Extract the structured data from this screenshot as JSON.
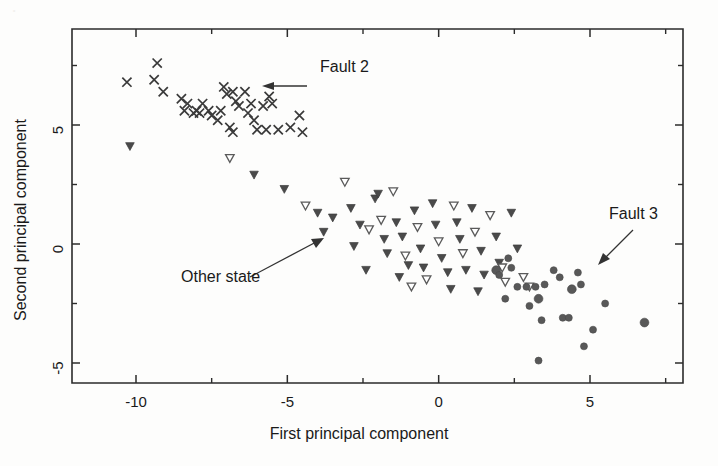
{
  "figure": {
    "title": "",
    "background_color": "#fdfdfc",
    "foreground_color": "#1a1a1a"
  },
  "axes": {
    "x_title": "First principal component",
    "y_title": "Second principal component",
    "x_tick_labels": [
      "-10",
      "-5",
      "0",
      "5"
    ],
    "y_tick_labels": [
      "5",
      "0",
      "-5"
    ]
  },
  "annotations": [
    {
      "id": "fault2",
      "label": "Fault 2",
      "x": 320,
      "y": 68
    },
    {
      "id": "other-state",
      "label": "Other state",
      "x": 181,
      "y": 276
    },
    {
      "id": "fault3",
      "label": "Fault 3",
      "x": 609,
      "y": 215
    }
  ],
  "chart_data": {
    "type": "scatter",
    "title": "",
    "xlabel": "First principal component",
    "ylabel": "Second principal component",
    "xlim": [
      -11.8,
      7.8
    ],
    "ylim": [
      -6.2,
      8.6
    ],
    "xticks": [
      -10,
      -5,
      0,
      5
    ],
    "yticks": [
      5,
      0,
      -5
    ],
    "grid": false,
    "legend": "none",
    "annotations": [
      "Fault 2",
      "Other state",
      "Fault 3"
    ],
    "series": [
      {
        "name": "Fault 2",
        "marker": "x",
        "color": "#3a3a3a",
        "points": [
          [
            -10.3,
            6.8
          ],
          [
            -9.3,
            7.6
          ],
          [
            -9.4,
            6.9
          ],
          [
            -9.1,
            6.4
          ],
          [
            -8.5,
            6.1
          ],
          [
            -8.3,
            5.9
          ],
          [
            -8.4,
            5.6
          ],
          [
            -8.1,
            5.5
          ],
          [
            -8.0,
            5.6
          ],
          [
            -7.9,
            5.5
          ],
          [
            -7.8,
            5.9
          ],
          [
            -7.6,
            5.6
          ],
          [
            -7.5,
            5.4
          ],
          [
            -7.3,
            5.2
          ],
          [
            -7.2,
            5.6
          ],
          [
            -7.0,
            6.3
          ],
          [
            -7.1,
            6.6
          ],
          [
            -6.8,
            6.4
          ],
          [
            -6.7,
            6.0
          ],
          [
            -6.6,
            5.8
          ],
          [
            -6.9,
            4.9
          ],
          [
            -6.8,
            4.7
          ],
          [
            -6.4,
            6.4
          ],
          [
            -6.2,
            5.9
          ],
          [
            -6.3,
            5.5
          ],
          [
            -6.1,
            5.2
          ],
          [
            -6.0,
            4.8
          ],
          [
            -5.7,
            4.8
          ],
          [
            -5.6,
            6.2
          ],
          [
            -5.5,
            5.9
          ],
          [
            -5.8,
            5.8
          ],
          [
            -5.3,
            4.8
          ],
          [
            -4.9,
            4.9
          ],
          [
            -4.6,
            5.4
          ],
          [
            -4.5,
            4.7
          ]
        ]
      },
      {
        "name": "Other state",
        "marker": "triangle-down",
        "color": "#4a4a4a",
        "points": [
          [
            -10.2,
            4.1
          ],
          [
            -6.9,
            3.6
          ],
          [
            -6.1,
            2.9
          ],
          [
            -5.1,
            2.3
          ],
          [
            -4.4,
            1.6
          ],
          [
            -4.0,
            1.3
          ],
          [
            -3.5,
            1.1
          ],
          [
            -3.1,
            2.6
          ],
          [
            -2.9,
            1.5
          ],
          [
            -2.6,
            0.8
          ],
          [
            -2.3,
            0.6
          ],
          [
            -2.1,
            1.9
          ],
          [
            -2.0,
            2.1
          ],
          [
            -1.9,
            1.0
          ],
          [
            -1.8,
            0.2
          ],
          [
            -1.7,
            -0.4
          ],
          [
            -1.5,
            2.2
          ],
          [
            -1.4,
            0.9
          ],
          [
            -1.2,
            0.3
          ],
          [
            -1.1,
            -0.5
          ],
          [
            -1.0,
            -0.9
          ],
          [
            -0.8,
            1.4
          ],
          [
            -0.7,
            0.7
          ],
          [
            -0.6,
            -0.2
          ],
          [
            -0.5,
            -1.0
          ],
          [
            -0.4,
            -1.5
          ],
          [
            -0.2,
            1.7
          ],
          [
            -0.1,
            0.8
          ],
          [
            0.0,
            0.1
          ],
          [
            0.1,
            -0.6
          ],
          [
            0.3,
            -1.2
          ],
          [
            0.5,
            1.6
          ],
          [
            0.6,
            0.9
          ],
          [
            0.7,
            0.2
          ],
          [
            0.8,
            -0.4
          ],
          [
            0.9,
            -1.1
          ],
          [
            1.1,
            1.5
          ],
          [
            1.2,
            0.5
          ],
          [
            1.4,
            -0.3
          ],
          [
            1.5,
            -1.3
          ],
          [
            1.7,
            1.2
          ],
          [
            1.9,
            0.3
          ],
          [
            2.0,
            -0.8
          ],
          [
            2.2,
            -1.6
          ],
          [
            2.4,
            1.3
          ],
          [
            2.6,
            -0.2
          ],
          [
            2.8,
            -1.4
          ],
          [
            -3.8,
            0.5
          ],
          [
            -2.4,
            -1.1
          ],
          [
            -0.9,
            -1.8
          ],
          [
            0.4,
            -1.9
          ],
          [
            1.3,
            -2.0
          ],
          [
            2.1,
            -1.0
          ],
          [
            -2.8,
            -0.1
          ],
          [
            -1.3,
            -1.4
          ],
          [
            3.0,
            -1.8
          ]
        ]
      },
      {
        "name": "Fault 3",
        "marker": "circle",
        "color": "#585858",
        "points": [
          [
            1.9,
            -1.1
          ],
          [
            2.0,
            -1.3
          ],
          [
            2.3,
            -0.6
          ],
          [
            2.4,
            -1.0
          ],
          [
            2.6,
            -1.8
          ],
          [
            2.9,
            -1.8
          ],
          [
            3.2,
            -1.8
          ],
          [
            3.3,
            -2.3
          ],
          [
            3.4,
            -3.2
          ],
          [
            3.5,
            -1.7
          ],
          [
            3.8,
            -1.1
          ],
          [
            4.0,
            -1.4
          ],
          [
            4.1,
            -3.1
          ],
          [
            4.3,
            -3.1
          ],
          [
            4.4,
            -1.9
          ],
          [
            4.6,
            -1.2
          ],
          [
            4.7,
            -1.7
          ],
          [
            4.8,
            -4.3
          ],
          [
            5.1,
            -3.6
          ],
          [
            5.5,
            -2.5
          ],
          [
            3.3,
            -4.9
          ],
          [
            6.8,
            -3.3
          ],
          [
            2.2,
            -2.3
          ],
          [
            3.0,
            -2.6
          ]
        ]
      }
    ]
  }
}
